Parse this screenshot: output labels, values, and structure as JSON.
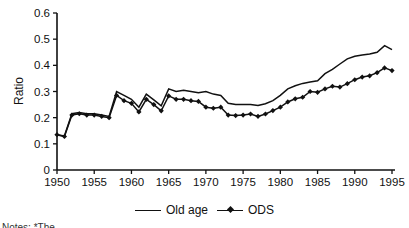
{
  "figure": {
    "footnote": "Notes: *The …"
  },
  "chart_data": {
    "type": "line",
    "title": "",
    "xlabel": "",
    "ylabel": "Ratio",
    "xlim": [
      1950,
      1995
    ],
    "ylim": [
      0,
      0.6
    ],
    "grid": false,
    "legend_position": "bottom-center",
    "x_ticks": [
      1950,
      1955,
      1960,
      1965,
      1970,
      1975,
      1980,
      1985,
      1990,
      1995
    ],
    "y_ticks": [
      0,
      0.1,
      0.2,
      0.3,
      0.4,
      0.5,
      0.6
    ],
    "y_tick_labels": [
      "0",
      "0.1",
      "0.2",
      "0.3",
      "0.4",
      "0.5",
      "0.6"
    ],
    "x": [
      1950,
      1951,
      1952,
      1953,
      1954,
      1955,
      1956,
      1957,
      1958,
      1959,
      1960,
      1961,
      1962,
      1963,
      1964,
      1965,
      1966,
      1967,
      1968,
      1969,
      1970,
      1971,
      1972,
      1973,
      1974,
      1975,
      1976,
      1977,
      1978,
      1979,
      1980,
      1981,
      1982,
      1983,
      1984,
      1985,
      1986,
      1987,
      1988,
      1989,
      1990,
      1991,
      1992,
      1993,
      1994,
      1995
    ],
    "series": [
      {
        "name": "Old age",
        "marker": "none",
        "color": "#111111",
        "values": [
          0.135,
          0.13,
          0.215,
          0.22,
          0.215,
          0.215,
          0.21,
          0.205,
          0.3,
          0.285,
          0.27,
          0.24,
          0.29,
          0.268,
          0.245,
          0.31,
          0.3,
          0.305,
          0.3,
          0.295,
          0.3,
          0.29,
          0.285,
          0.255,
          0.25,
          0.25,
          0.25,
          0.246,
          0.253,
          0.265,
          0.285,
          0.31,
          0.322,
          0.331,
          0.336,
          0.341,
          0.368,
          0.385,
          0.405,
          0.425,
          0.435,
          0.44,
          0.443,
          0.45,
          0.475,
          0.46
        ]
      },
      {
        "name": "ODS",
        "marker": "diamond",
        "color": "#111111",
        "values": [
          0.135,
          0.128,
          0.21,
          0.215,
          0.21,
          0.21,
          0.205,
          0.2,
          0.285,
          0.265,
          0.255,
          0.222,
          0.27,
          0.25,
          0.226,
          0.283,
          0.27,
          0.27,
          0.265,
          0.262,
          0.24,
          0.236,
          0.24,
          0.21,
          0.208,
          0.21,
          0.214,
          0.205,
          0.214,
          0.227,
          0.24,
          0.26,
          0.272,
          0.278,
          0.3,
          0.297,
          0.31,
          0.32,
          0.317,
          0.33,
          0.345,
          0.355,
          0.36,
          0.372,
          0.39,
          0.38
        ]
      }
    ]
  }
}
